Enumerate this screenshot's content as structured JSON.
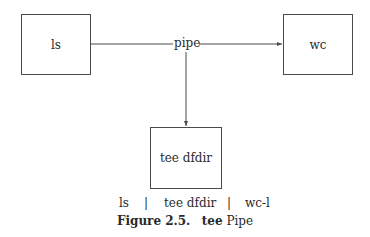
{
  "diagram": {
    "nodes": {
      "ls": "ls",
      "wc": "wc",
      "tee": "tee dfdir"
    },
    "connector_label": "pipe",
    "edges": [
      {
        "from": "ls",
        "to": "wc",
        "via": "pipe"
      },
      {
        "from": "pipe",
        "to": "tee"
      }
    ]
  },
  "command": {
    "parts": [
      "ls",
      "|",
      "tee dfdir",
      "|",
      "wc-l"
    ]
  },
  "caption": {
    "number": "Figure 2.5.",
    "bold_word": "tee",
    "rest": "Pipe"
  },
  "colors": {
    "line": "#4a4a4a",
    "text": "#2a2a2a"
  }
}
